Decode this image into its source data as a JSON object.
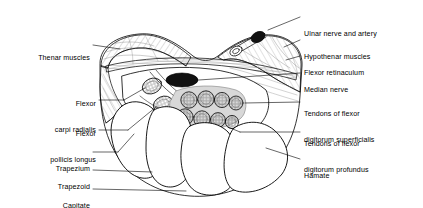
{
  "figure": {
    "type": "anatomical-cross-section",
    "background_color": "#ffffff",
    "line_color": "#000000",
    "fill_tendon_sheath": "#d8d8d8",
    "fill_nerve": "#111111"
  },
  "labels_left": [
    {
      "id": "thenar-muscles",
      "text": "Thenar muscles",
      "lines": [
        "Thenar muscles"
      ],
      "x": 14,
      "y": 41,
      "leader": {
        "x1": 93,
        "y1": 45,
        "x2": 120,
        "y2": 49
      }
    },
    {
      "id": "flexor-carpi-radialis",
      "text": "Flexor carpi radialis",
      "lines": [
        "Flexor",
        "carpi radialis"
      ],
      "x": 14,
      "y": 84,
      "leader": {
        "x1": 99,
        "y1": 100,
        "x2": 157,
        "y2": 86
      }
    },
    {
      "id": "flexor-pollicis-longus",
      "text": "Flexor pollicis longus",
      "lines": [
        "Flexor",
        "pollicis longus"
      ],
      "x": 14,
      "y": 113,
      "leader": {
        "x1": 99,
        "y1": 130,
        "x2": 163,
        "y2": 104
      }
    },
    {
      "id": "trapezium",
      "text": "Trapezium",
      "lines": [
        "Trapezium"
      ],
      "x": 14,
      "y": 148,
      "leader": {
        "x1": 93,
        "y1": 152,
        "x2": 134,
        "y2": 132
      }
    },
    {
      "id": "trapezoid",
      "text": "Trapezoid",
      "lines": [
        "Trapezoid"
      ],
      "x": 14,
      "y": 166,
      "leader": {
        "x1": 93,
        "y1": 170,
        "x2": 150,
        "y2": 172
      }
    },
    {
      "id": "capitate",
      "text": "Capitate",
      "lines": [
        "Capitate"
      ],
      "x": 14,
      "y": 185,
      "leader": {
        "x1": 93,
        "y1": 189,
        "x2": 184,
        "y2": 190
      }
    }
  ],
  "labels_right": [
    {
      "id": "ulnar-nerve-and-artery",
      "text": "Ulnar nerve and artery",
      "lines": [
        "Ulnar nerve and artery"
      ],
      "x": 303,
      "y": 12,
      "leader": {
        "x1": 300,
        "y1": 17,
        "x2": 258,
        "y2": 33
      }
    },
    {
      "id": "hypothenar-muscles",
      "text": "Hypothenar muscles",
      "lines": [
        "Hypothenar muscles"
      ],
      "x": 303,
      "y": 36,
      "leader": {
        "x1": 300,
        "y1": 40,
        "x2": 281,
        "y2": 47
      }
    },
    {
      "id": "flexor-retinaculum",
      "text": "Flexor retinaculum",
      "lines": [
        "Flexor retinaculum"
      ],
      "x": 303,
      "y": 52,
      "leader": {
        "x1": 300,
        "y1": 56,
        "x2": 283,
        "y2": 60
      }
    },
    {
      "id": "median-nerve",
      "text": "Median nerve",
      "lines": [
        "Median nerve"
      ],
      "x": 303,
      "y": 69,
      "leader": {
        "x1": 300,
        "y1": 73,
        "x2": 198,
        "y2": 80
      }
    },
    {
      "id": "tendons-flexor-digitorum-superficialis",
      "text": "Tendons of flexor digitorum superficialis",
      "lines": [
        "Tendons of flexor",
        "digitorum superficialis"
      ],
      "x": 303,
      "y": 89,
      "leader": {
        "x1": 300,
        "y1": 102,
        "x2": 243,
        "y2": 103
      }
    },
    {
      "id": "tendons-flexor-digitorum-profundus",
      "text": "Tendons of flexor digitorum profundus",
      "lines": [
        "Tendons of flexor",
        "digitorum profundus"
      ],
      "x": 303,
      "y": 119,
      "leader": {
        "x1": 300,
        "y1": 132,
        "x2": 231,
        "y2": 126
      }
    },
    {
      "id": "hamate",
      "text": "Hamate",
      "lines": [
        "Hamate"
      ],
      "x": 303,
      "y": 155,
      "leader": {
        "x1": 300,
        "y1": 159,
        "x2": 262,
        "y2": 146
      }
    }
  ],
  "structures": [
    {
      "id": "median-nerve-body",
      "name": "median nerve"
    },
    {
      "id": "ulnar-nerve-body",
      "name": "ulnar nerve"
    },
    {
      "id": "ulnar-artery-body",
      "name": "ulnar artery"
    },
    {
      "id": "thenar-mass",
      "name": "thenar muscle mass"
    },
    {
      "id": "hypothenar-mass",
      "name": "hypothenar muscle mass"
    },
    {
      "id": "retinaculum-band",
      "name": "flexor retinaculum"
    },
    {
      "id": "fds-tendon-row",
      "name": "flexor digitorum superficialis tendons",
      "count": 4
    },
    {
      "id": "fdp-tendon-row",
      "name": "flexor digitorum profundus tendons",
      "count": 4
    },
    {
      "id": "fcr-tendon",
      "name": "flexor carpi radialis tendon"
    },
    {
      "id": "fpl-tendon",
      "name": "flexor pollicis longus tendon"
    },
    {
      "id": "trapezium-bone",
      "name": "trapezium"
    },
    {
      "id": "trapezoid-bone",
      "name": "trapezoid"
    },
    {
      "id": "capitate-bone",
      "name": "capitate"
    },
    {
      "id": "hamate-bone",
      "name": "hamate"
    }
  ]
}
